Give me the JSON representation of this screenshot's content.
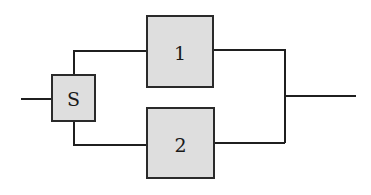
{
  "diagram": {
    "type": "reliability-block-diagram",
    "colors": {
      "block_fill": "#dedede",
      "stroke": "#1f1f1f",
      "background": "#ffffff"
    },
    "blocks": [
      {
        "id": "S",
        "label": "S",
        "x": 52,
        "y": 75,
        "w": 43,
        "h": 46
      },
      {
        "id": "1",
        "label": "1",
        "x": 147,
        "y": 16,
        "w": 66,
        "h": 71
      },
      {
        "id": "2",
        "label": "2",
        "x": 147,
        "y": 108,
        "w": 67,
        "h": 70
      }
    ],
    "connections": [
      {
        "from": "input",
        "to": "S"
      },
      {
        "from": "S",
        "to": "1"
      },
      {
        "from": "S",
        "to": "2"
      },
      {
        "from": "1",
        "to": "output"
      },
      {
        "from": "2",
        "to": "output"
      }
    ]
  }
}
